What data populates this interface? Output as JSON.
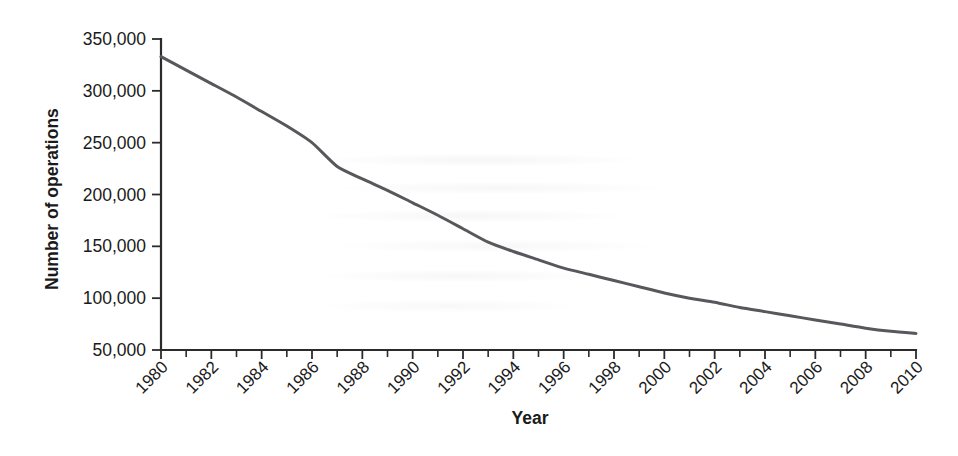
{
  "figure": {
    "background_color": "#ffffff",
    "line_color": "#58585c",
    "axis_color": "#2b2b2b"
  },
  "chart_data": {
    "type": "line",
    "title": "",
    "subtitle": "",
    "xlabel": "Year",
    "ylabel": "Number of operations",
    "xlim": [
      1980,
      2010
    ],
    "ylim": [
      50000,
      350000
    ],
    "grid": false,
    "legend": false,
    "legend_position": "none",
    "x_tick_labels": [
      "1980",
      "1982",
      "1984",
      "1986",
      "1988",
      "1990",
      "1992",
      "1994",
      "1996",
      "1998",
      "2000",
      "2002",
      "2004",
      "2006",
      "2008",
      "2010"
    ],
    "x_tick_values": [
      1980,
      1982,
      1984,
      1986,
      1988,
      1990,
      1992,
      1994,
      1996,
      1998,
      2000,
      2002,
      2004,
      2006,
      2008,
      2010
    ],
    "x_minor_tick_values": [
      1981,
      1983,
      1985,
      1987,
      1989,
      1991,
      1993,
      1995,
      1997,
      1999,
      2001,
      2003,
      2005,
      2007,
      2009
    ],
    "y_tick_labels": [
      "50,000",
      "100,000",
      "150,000",
      "200,000",
      "250,000",
      "300,000",
      "350,000"
    ],
    "y_tick_values": [
      50000,
      100000,
      150000,
      200000,
      250000,
      300000,
      350000
    ],
    "x": [
      1980,
      1981,
      1982,
      1983,
      1984,
      1985,
      1986,
      1987,
      1988,
      1989,
      1990,
      1991,
      1992,
      1993,
      1994,
      1995,
      1996,
      1997,
      1998,
      1999,
      2000,
      2001,
      2002,
      2003,
      2004,
      2005,
      2006,
      2007,
      2008,
      2009,
      2010
    ],
    "values": [
      333000,
      320000,
      307000,
      294000,
      280000,
      266000,
      250000,
      227000,
      215000,
      204000,
      192000,
      180000,
      167000,
      154000,
      145000,
      137000,
      129000,
      123000,
      117000,
      111000,
      105000,
      100000,
      96000,
      91000,
      87000,
      83000,
      79000,
      75000,
      71000,
      68000,
      66000
    ],
    "series": [
      {
        "name": "Number of operations",
        "values": [
          333000,
          320000,
          307000,
          294000,
          280000,
          266000,
          250000,
          227000,
          215000,
          204000,
          192000,
          180000,
          167000,
          154000,
          145000,
          137000,
          129000,
          123000,
          117000,
          111000,
          105000,
          100000,
          96000,
          91000,
          87000,
          83000,
          79000,
          75000,
          71000,
          68000,
          66000
        ]
      }
    ]
  }
}
